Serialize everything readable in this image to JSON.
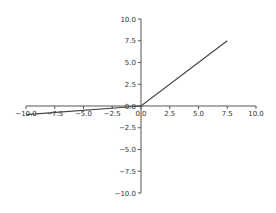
{
  "chart_data": {
    "type": "line",
    "title": "",
    "xlabel": "",
    "ylabel": "",
    "xlim": [
      -10,
      10
    ],
    "ylim": [
      -10,
      10
    ],
    "grid": false,
    "legend": null,
    "spines": "centered",
    "x_ticks": [
      "-10.0",
      "-7.5",
      "-5.0",
      "-2.5",
      "0.0",
      "2.5",
      "5.0",
      "7.5",
      "10.0"
    ],
    "y_ticks": [
      "10.0",
      "7.5",
      "5.0",
      "2.5",
      "0.0",
      "-2.5",
      "-5.0",
      "-7.5",
      "-10.0"
    ],
    "series": [
      {
        "name": "leaky_relu",
        "x": [
          -10,
          0,
          7.5
        ],
        "y": [
          -1,
          0,
          7.5
        ],
        "color": "#444444"
      }
    ]
  },
  "colors": {
    "axis": "#555555",
    "line": "#444444",
    "text": "#333333"
  }
}
